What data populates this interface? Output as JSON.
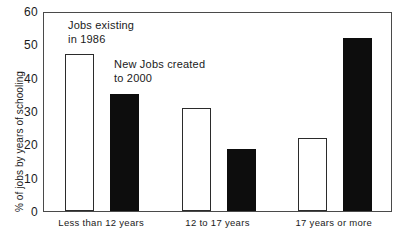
{
  "figure": {
    "top_clipped_text": "",
    "background_color": "#ffffff",
    "axis_color": "#4a4a4a",
    "open_bar_color": "#ffffff",
    "filled_bar_color": "#0d0d0d"
  },
  "chart_data": {
    "type": "bar",
    "title": "",
    "xlabel": "",
    "ylabel": "% of jobs by years of schooling",
    "categories": [
      "Less than 12 years",
      "12 to 17 years",
      "17 years or more"
    ],
    "series": [
      {
        "name": "Jobs existing in 1986",
        "style": "open",
        "values": [
          47,
          31,
          22
        ]
      },
      {
        "name": "New Jobs created to 2000",
        "style": "filled",
        "values": [
          35,
          18.5,
          52
        ]
      }
    ],
    "ylim": [
      0,
      60
    ],
    "yticks": [
      0,
      10,
      20,
      30,
      40,
      50,
      60
    ],
    "ytick_labels": [
      "0",
      "10",
      "20",
      "30",
      "40",
      "50",
      "60"
    ],
    "grid": false,
    "legend": "annotations",
    "annotations": [
      {
        "text": "Jobs existing\nin 1986"
      },
      {
        "text": "New Jobs created\nto 2000"
      }
    ]
  }
}
